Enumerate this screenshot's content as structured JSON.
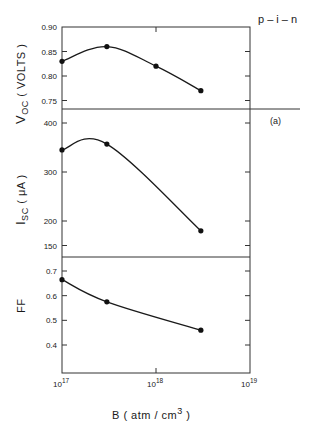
{
  "chart_data": {
    "type": "line",
    "figure_label": "p – i – n",
    "panel_label": "(a)",
    "xlabel_main": "B  ( atm / cm",
    "xlabel_sup": "3",
    "xlabel_end": " )",
    "xscale": "log",
    "xlim": [
      1e+17,
      1e+19
    ],
    "xticks": [
      {
        "value": 1e+17,
        "base": "10",
        "exp": "17"
      },
      {
        "value": 1e+18,
        "base": "10",
        "exp": "18"
      },
      {
        "value": 1e+19,
        "base": "10",
        "exp": "19"
      }
    ],
    "grid": false,
    "panels": [
      {
        "name": "voc",
        "ylabel_main": "V",
        "ylabel_sub": "OC",
        "ylabel_end": "  ( VOLTS )",
        "ylim": [
          0.73,
          0.9
        ],
        "yticks": [
          0.9,
          0.85,
          0.8,
          0.75
        ],
        "ytick_labels": [
          "0.90",
          "0.85",
          "0.80",
          "0.75"
        ],
        "series": [
          {
            "name": "Voc",
            "x": [
              1e+17,
              3e+17,
              1e+18,
              3e+18
            ],
            "y": [
              0.83,
              0.86,
              0.82,
              0.77
            ]
          }
        ]
      },
      {
        "name": "isc",
        "ylabel_main": "I",
        "ylabel_sub": "SC",
        "ylabel_end": "  ( μA )",
        "ylim": [
          128,
          428
        ],
        "yticks": [
          400,
          300,
          200,
          150
        ],
        "ytick_labels": [
          "400",
          "300",
          "200",
          "150"
        ],
        "series": [
          {
            "name": "Isc",
            "x": [
              1e+17,
              3e+17,
              3e+18
            ],
            "y": [
              345,
              357,
              180
            ]
          }
        ]
      },
      {
        "name": "ff",
        "ylabel_main": "FF",
        "ylabel_sub": "",
        "ylabel_end": "",
        "ylim": [
          0.3,
          0.76
        ],
        "yticks": [
          0.7,
          0.6,
          0.5,
          0.4
        ],
        "ytick_labels": [
          "0.7",
          "0.6",
          "0.5",
          "0.4"
        ],
        "series": [
          {
            "name": "FF",
            "x": [
              1e+17,
              3e+17,
              3e+18
            ],
            "y": [
              0.665,
              0.575,
              0.46
            ]
          }
        ]
      }
    ]
  }
}
